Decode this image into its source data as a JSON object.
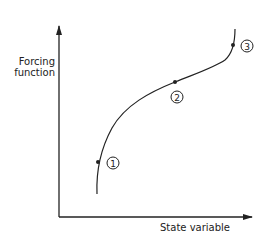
{
  "diagram": {
    "y_axis_label_line1": "Forcing",
    "y_axis_label_line2": "function",
    "x_axis_label": "State variable",
    "points": [
      {
        "label": "1"
      },
      {
        "label": "2"
      },
      {
        "label": "3"
      }
    ],
    "colors": {
      "ink": "#222222",
      "background": "#ffffff"
    }
  }
}
